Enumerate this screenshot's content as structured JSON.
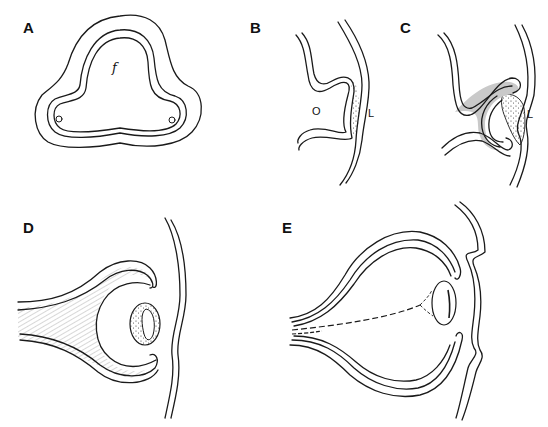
{
  "figure": {
    "colors": {
      "ink": "#1a1a1a",
      "shading": "#bdbdbd",
      "background": "#ffffff"
    },
    "panels": [
      {
        "id": "A",
        "label": "A",
        "annotations": [
          {
            "text": "f"
          }
        ]
      },
      {
        "id": "B",
        "label": "B",
        "annotations": [
          {
            "text": "O"
          },
          {
            "text": "L"
          }
        ]
      },
      {
        "id": "C",
        "label": "C",
        "annotations": [
          {
            "text": "L"
          }
        ]
      },
      {
        "id": "D",
        "label": "D",
        "annotations": []
      },
      {
        "id": "E",
        "label": "E",
        "annotations": []
      }
    ]
  }
}
